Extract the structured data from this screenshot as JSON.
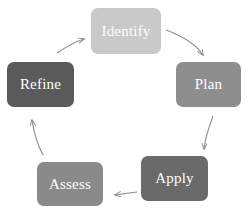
{
  "diagram": {
    "type": "cycle",
    "title": "",
    "direction": "clockwise",
    "background_color": "#ffffff",
    "label_color": "#ffffff",
    "arrow_color": "#8c8c8c",
    "nodes": [
      {
        "id": "identify",
        "label": "Identify",
        "color": "#c9c9c9",
        "x": 91,
        "y": 8,
        "width": 70,
        "height": 46,
        "font_size": 15
      },
      {
        "id": "plan",
        "label": "Plan",
        "color": "#8e8e8e",
        "x": 176,
        "y": 62,
        "width": 65,
        "height": 45,
        "font_size": 15
      },
      {
        "id": "apply",
        "label": "Apply",
        "color": "#6a6a6a",
        "x": 141,
        "y": 156,
        "width": 67,
        "height": 45,
        "font_size": 15
      },
      {
        "id": "assess",
        "label": "Assess",
        "color": "#8a8a8a",
        "x": 37,
        "y": 162,
        "width": 66,
        "height": 44,
        "font_size": 15
      },
      {
        "id": "refine",
        "label": "Refine",
        "color": "#5a5a5a",
        "x": 7,
        "y": 62,
        "width": 67,
        "height": 45,
        "font_size": 15
      }
    ],
    "arrows": [
      {
        "id": "identify-to-plan",
        "from": "identify",
        "to": "plan"
      },
      {
        "id": "plan-to-apply",
        "from": "plan",
        "to": "apply"
      },
      {
        "id": "apply-to-assess",
        "from": "apply",
        "to": "assess"
      },
      {
        "id": "assess-to-refine",
        "from": "assess",
        "to": "refine"
      },
      {
        "id": "refine-to-identify",
        "from": "refine",
        "to": "identify"
      }
    ]
  }
}
